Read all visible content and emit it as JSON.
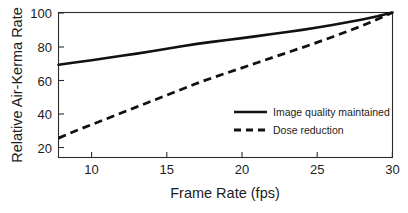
{
  "chart_data": {
    "type": "line",
    "title": "",
    "xlabel": "Frame Rate (fps)",
    "ylabel": "Relative Air-Kerma Rate",
    "xlim": [
      7.8,
      30
    ],
    "ylim": [
      14,
      100
    ],
    "grid": false,
    "legend_position": "center-right",
    "xticks": [
      10,
      15,
      20,
      25,
      30
    ],
    "yticks": [
      20,
      40,
      60,
      80,
      100
    ],
    "xtick_labels": [
      "10",
      "15",
      "20",
      "25",
      "30"
    ],
    "ytick_labels": [
      "20",
      "40",
      "60",
      "80",
      "100"
    ],
    "series": [
      {
        "name": "Image quality maintained",
        "style": "solid",
        "color": "#111111",
        "x": [
          7.8,
          9,
          10,
          11,
          12,
          13,
          14,
          15,
          16,
          17,
          18,
          19,
          20,
          21,
          22,
          23,
          24,
          25,
          26,
          27,
          28,
          29,
          30
        ],
        "values": [
          69,
          70.5,
          71.7,
          73,
          74.3,
          75.6,
          77,
          78.5,
          80,
          81.4,
          82.6,
          83.7,
          84.8,
          86,
          87.2,
          88.4,
          89.7,
          91.1,
          92.6,
          94.2,
          95.9,
          97.8,
          100
        ]
      },
      {
        "name": "Dose reduction",
        "style": "dashed",
        "color": "#111111",
        "x": [
          7.8,
          9,
          10,
          11,
          12,
          13,
          14,
          15,
          16,
          17,
          18,
          19,
          20,
          21,
          22,
          23,
          24,
          25,
          26,
          27,
          28,
          29,
          30
        ],
        "values": [
          25.5,
          30,
          33.5,
          37,
          40.5,
          44,
          47.5,
          51,
          54.5,
          58,
          61.2,
          64.2,
          67.2,
          70.2,
          73.2,
          76.2,
          79.2,
          82.3,
          85.5,
          88.8,
          92.2,
          96,
          100
        ]
      }
    ],
    "legend_entries": [
      {
        "label": "Image quality maintained",
        "style": "solid"
      },
      {
        "label": "Dose reduction",
        "style": "dashed"
      }
    ]
  }
}
